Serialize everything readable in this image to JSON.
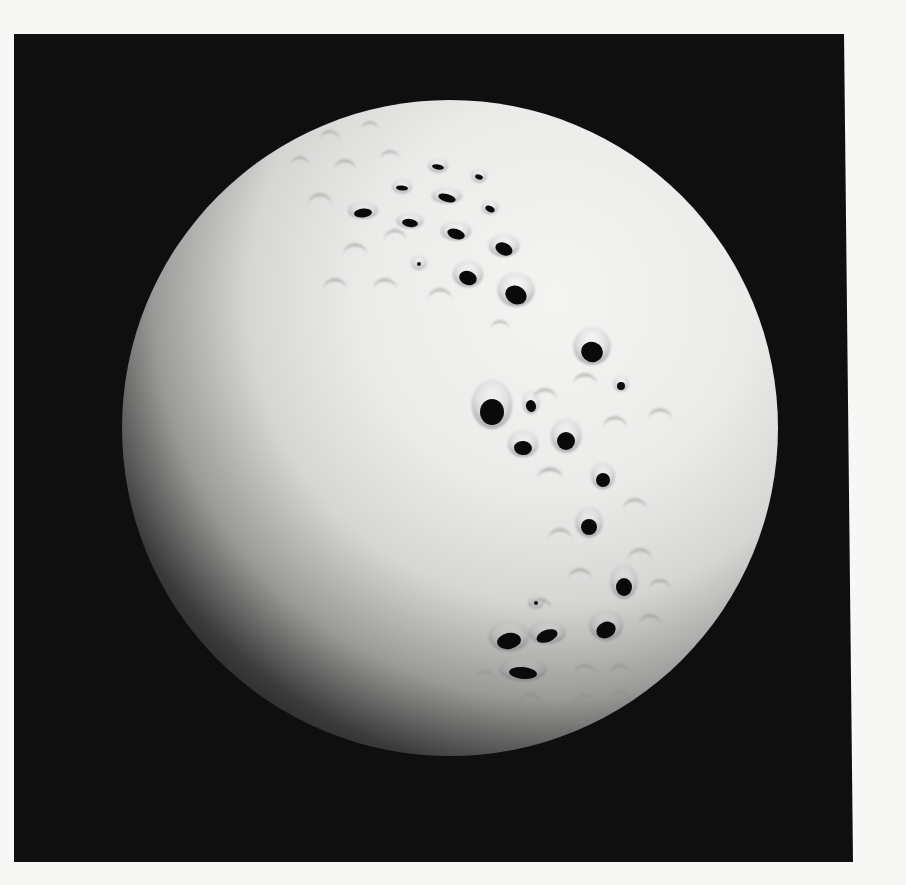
{
  "image": {
    "subject": "White porcelain sphere with perforated dimple pattern",
    "caption": "Pierced white sphere sculpture on black background"
  },
  "colors": {
    "page": "#f7f7f6",
    "backdrop": "#0f0f0f",
    "sphere_highlight": "#f2f2f0",
    "sphere_mid": "#d8d8d6",
    "sphere_shadow": "#1a1a1a",
    "hole": "#0a0a0a"
  },
  "backdrop": {
    "points": "14,34 844,34 853,862 14,862"
  },
  "sphere": {
    "cx": 450,
    "cy": 428,
    "r": 328
  },
  "holes": [
    {
      "x": 438,
      "y": 167,
      "rx": 6,
      "ry": 2.5,
      "rot": 10
    },
    {
      "x": 479,
      "y": 177,
      "rx": 4,
      "ry": 2.5,
      "rot": 20
    },
    {
      "x": 402,
      "y": 188,
      "rx": 6,
      "ry": 2.5,
      "rot": 5
    },
    {
      "x": 447,
      "y": 198,
      "rx": 9,
      "ry": 4,
      "rot": 15
    },
    {
      "x": 490,
      "y": 209,
      "rx": 5,
      "ry": 3,
      "rot": 25
    },
    {
      "x": 363,
      "y": 213,
      "rx": 9,
      "ry": 4.5,
      "rot": -5
    },
    {
      "x": 410,
      "y": 223,
      "rx": 8,
      "ry": 4,
      "rot": 8
    },
    {
      "x": 456,
      "y": 234,
      "rx": 9,
      "ry": 5,
      "rot": 18
    },
    {
      "x": 504,
      "y": 249,
      "rx": 9,
      "ry": 6,
      "rot": 25
    },
    {
      "x": 419,
      "y": 264,
      "rx": 2,
      "ry": 2,
      "rot": 0
    },
    {
      "x": 468,
      "y": 278,
      "rx": 9,
      "ry": 7,
      "rot": 20
    },
    {
      "x": 516,
      "y": 295,
      "rx": 11,
      "ry": 9,
      "rot": 25
    },
    {
      "x": 592,
      "y": 352,
      "rx": 11,
      "ry": 10,
      "rot": 20
    },
    {
      "x": 621,
      "y": 386,
      "rx": 4,
      "ry": 4,
      "rot": 0
    },
    {
      "x": 492,
      "y": 412,
      "rx": 12,
      "ry": 13,
      "rot": 0
    },
    {
      "x": 531,
      "y": 406,
      "rx": 5,
      "ry": 6,
      "rot": -15
    },
    {
      "x": 523,
      "y": 448,
      "rx": 9,
      "ry": 7,
      "rot": 5
    },
    {
      "x": 566,
      "y": 441,
      "rx": 9,
      "ry": 9,
      "rot": 0
    },
    {
      "x": 603,
      "y": 480,
      "rx": 7,
      "ry": 7,
      "rot": 0
    },
    {
      "x": 589,
      "y": 527,
      "rx": 8,
      "ry": 8,
      "rot": 0
    },
    {
      "x": 624,
      "y": 587,
      "rx": 8,
      "ry": 9,
      "rot": 0
    },
    {
      "x": 536,
      "y": 603,
      "rx": 2,
      "ry": 2,
      "rot": 0
    },
    {
      "x": 509,
      "y": 641,
      "rx": 12,
      "ry": 8,
      "rot": -10
    },
    {
      "x": 547,
      "y": 636,
      "rx": 11,
      "ry": 6,
      "rot": -20
    },
    {
      "x": 606,
      "y": 630,
      "rx": 10,
      "ry": 8,
      "rot": -25
    },
    {
      "x": 523,
      "y": 673,
      "rx": 14,
      "ry": 6,
      "rot": 5
    }
  ],
  "dimples": [
    {
      "x": 330,
      "y": 140,
      "r": 10
    },
    {
      "x": 370,
      "y": 130,
      "r": 9
    },
    {
      "x": 300,
      "y": 165,
      "r": 9
    },
    {
      "x": 345,
      "y": 170,
      "r": 11
    },
    {
      "x": 390,
      "y": 160,
      "r": 10
    },
    {
      "x": 320,
      "y": 205,
      "r": 12
    },
    {
      "x": 355,
      "y": 255,
      "r": 12
    },
    {
      "x": 395,
      "y": 240,
      "r": 11
    },
    {
      "x": 335,
      "y": 290,
      "r": 12
    },
    {
      "x": 385,
      "y": 290,
      "r": 12
    },
    {
      "x": 440,
      "y": 300,
      "r": 12
    },
    {
      "x": 500,
      "y": 330,
      "r": 10
    },
    {
      "x": 585,
      "y": 385,
      "r": 12
    },
    {
      "x": 615,
      "y": 428,
      "r": 12
    },
    {
      "x": 660,
      "y": 420,
      "r": 12
    },
    {
      "x": 545,
      "y": 400,
      "r": 12
    },
    {
      "x": 550,
      "y": 480,
      "r": 13
    },
    {
      "x": 635,
      "y": 510,
      "r": 12
    },
    {
      "x": 560,
      "y": 540,
      "r": 12
    },
    {
      "x": 640,
      "y": 560,
      "r": 12
    },
    {
      "x": 660,
      "y": 590,
      "r": 11
    },
    {
      "x": 580,
      "y": 580,
      "r": 12
    },
    {
      "x": 540,
      "y": 610,
      "r": 12
    },
    {
      "x": 650,
      "y": 625,
      "r": 11
    },
    {
      "x": 585,
      "y": 675,
      "r": 11
    },
    {
      "x": 620,
      "y": 675,
      "r": 11
    },
    {
      "x": 485,
      "y": 680,
      "r": 10
    },
    {
      "x": 530,
      "y": 705,
      "r": 12
    },
    {
      "x": 585,
      "y": 705,
      "r": 11
    },
    {
      "x": 620,
      "y": 700,
      "r": 10
    },
    {
      "x": 580,
      "y": 730,
      "r": 10
    }
  ]
}
